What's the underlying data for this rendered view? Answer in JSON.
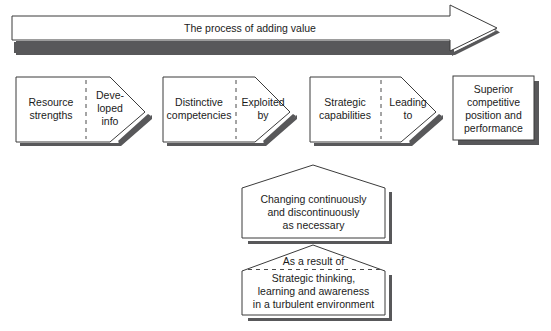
{
  "diagram": {
    "title_banner": {
      "label": "The process of adding value",
      "shape": "right-arrow-banner"
    },
    "flow": {
      "stages": [
        {
          "id": "resource-strengths",
          "shape": "pentagon-right-arrow",
          "main_label_lines": [
            "Resource",
            "strengths"
          ],
          "connector_label_lines": [
            "Deve-",
            "loped",
            "info"
          ]
        },
        {
          "id": "distinctive-competencies",
          "shape": "pentagon-right-arrow",
          "main_label_lines": [
            "Distinctive",
            "competencies"
          ],
          "connector_label_lines": [
            "Exploited",
            "by"
          ]
        },
        {
          "id": "strategic-capabilities",
          "shape": "pentagon-right-arrow",
          "main_label_lines": [
            "Strategic",
            "capabilities"
          ],
          "connector_label_lines": [
            "Leading",
            "to"
          ]
        },
        {
          "id": "superior-competitive-position",
          "shape": "rectangle",
          "main_label_lines": [
            "Superior",
            "competitive",
            "position and",
            "performance"
          ],
          "connector_label_lines": []
        }
      ]
    },
    "callouts": [
      {
        "id": "changing-continuously",
        "shape": "pentagon-up",
        "header_label": "",
        "body_lines": [
          "Changing continuously",
          "and discontinuously",
          "as necessary"
        ]
      },
      {
        "id": "strategic-thinking",
        "shape": "pentagon-up",
        "header_label": "As a result of",
        "body_lines": [
          "Strategic thinking,",
          "learning and awareness",
          "in a turbulent environment"
        ]
      }
    ],
    "colors": {
      "outline": "#3b3b3b",
      "shadow": "#58585a",
      "fill": "#ffffff",
      "text": "#1b1b1b",
      "divider": "#4a4a4a"
    }
  }
}
